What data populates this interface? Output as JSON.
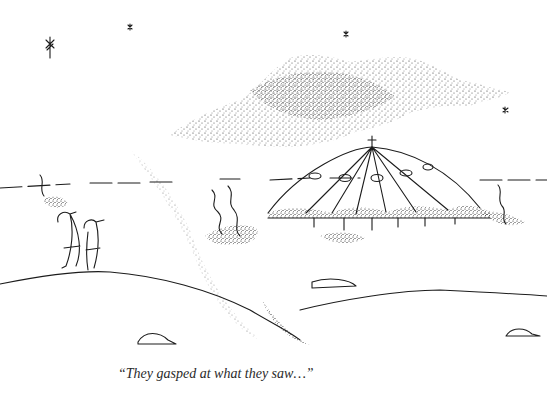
{
  "illustration": {
    "type": "cartoon",
    "subject": "two figures on a hillside watching a domed saucer-like structure under a stippled cloud",
    "caption": "“They gasped at what they saw…”",
    "ink_color": "#1c1c1c",
    "background_color": "#ffffff"
  }
}
